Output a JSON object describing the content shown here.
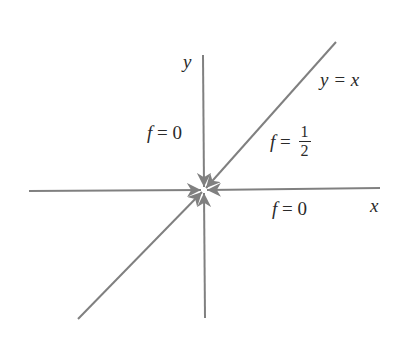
{
  "diagram": {
    "line_color": "#808080",
    "text_color": "#2a2a2a",
    "axes": {
      "x_label": "x",
      "y_label": "y"
    },
    "line_labels": {
      "diagonal": "y = x"
    },
    "region_labels": {
      "y_axis": {
        "lhs": "f",
        "eq": " = ",
        "value": "0"
      },
      "x_axis": {
        "lhs": "f",
        "eq": " = ",
        "value": "0"
      },
      "diagonal": {
        "lhs": "f",
        "eq": " = ",
        "num": "1",
        "den": "2"
      }
    },
    "arrows_converge_at": "origin"
  }
}
